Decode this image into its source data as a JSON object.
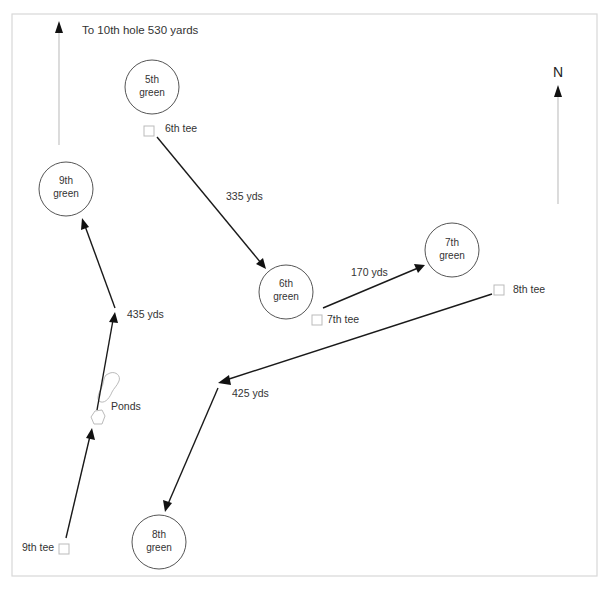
{
  "map": {
    "title_note": "To 10th hole 530 yards",
    "north_label": "N",
    "greens": [
      {
        "id": "5th",
        "line1": "5th",
        "line2": "green"
      },
      {
        "id": "6th",
        "line1": "6th",
        "line2": "green"
      },
      {
        "id": "7th",
        "line1": "7th",
        "line2": "green"
      },
      {
        "id": "8th",
        "line1": "8th",
        "line2": "green"
      },
      {
        "id": "9th",
        "line1": "9th",
        "line2": "green"
      }
    ],
    "tees": [
      {
        "id": "6th",
        "label": "6th tee"
      },
      {
        "id": "7th",
        "label": "7th tee"
      },
      {
        "id": "8th",
        "label": "8th tee"
      },
      {
        "id": "9th",
        "label": "9th tee"
      }
    ],
    "distances": {
      "hole6": "335 yds",
      "hole7": "170 yds",
      "hole8": "425 yds",
      "hole9": "435 yds"
    },
    "hazard_label": "Ponds",
    "colors": {
      "path": "#1a1a1a",
      "guide": "#c4c4c4",
      "green_stroke": "#555555",
      "tee_stroke": "#bbbbbb",
      "frame": "#d8d8d8"
    }
  }
}
